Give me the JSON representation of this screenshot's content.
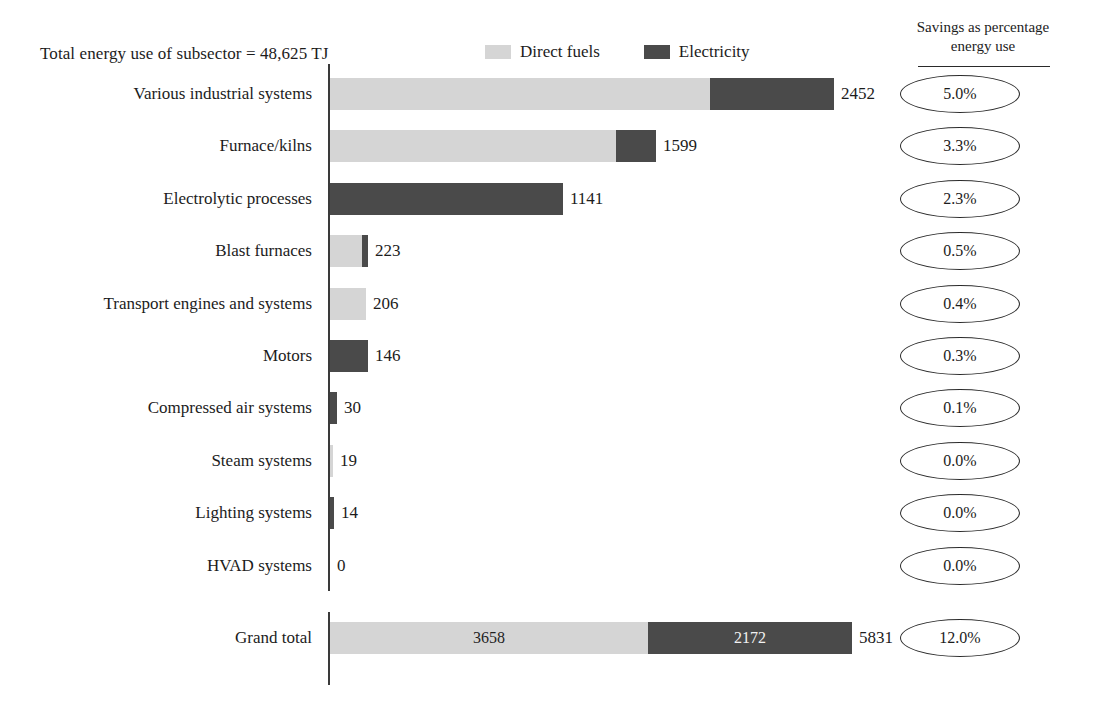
{
  "title": "Total energy use of subsector = 48,625 TJ",
  "legend": [
    {
      "label": "Direct fuels",
      "color": "#d5d5d5"
    },
    {
      "label": "Electricity",
      "color": "#4a4a4a"
    }
  ],
  "savings_header": {
    "line1": "Savings as percentage",
    "line2": "energy use"
  },
  "colors": {
    "direct_fuels": "#d5d5d5",
    "electricity": "#4a4a4a",
    "axis": "#3a3a3a",
    "text": "#1c1c1c"
  },
  "chart_data": {
    "type": "bar",
    "orientation": "horizontal",
    "stacked": true,
    "title": "Total energy use of subsector = 48,625 TJ",
    "xlabel": "",
    "ylabel": "",
    "grid": false,
    "legend_position": "top",
    "categories": [
      "Various industrial systems",
      "Furnace/kilns",
      "Electrolytic processes",
      "Blast furnaces",
      "Transport engines and systems",
      "Motors",
      "Compressed air systems",
      "Steam systems",
      "Lighting systems",
      "HVAD systems"
    ],
    "series": [
      {
        "name": "Direct fuels",
        "color": "#d5d5d5",
        "values": [
          1948,
          1448,
          0,
          209,
          206,
          0,
          0,
          19,
          0,
          0
        ]
      },
      {
        "name": "Electricity",
        "color": "#4a4a4a",
        "values": [
          504,
          151,
          1141,
          14,
          0,
          146,
          30,
          0,
          14,
          0
        ]
      }
    ],
    "totals": [
      2452,
      1599,
      1141,
      223,
      206,
      146,
      30,
      19,
      14,
      0
    ],
    "total_labels": [
      "2452",
      "1599",
      "1141",
      "223",
      "206",
      "146",
      "30",
      "19",
      "14",
      "0"
    ],
    "savings_percent": [
      "5.0%",
      "3.3%",
      "2.3%",
      "0.5%",
      "0.4%",
      "0.3%",
      "0.1%",
      "0.0%",
      "0.0%",
      "0.0%"
    ],
    "grand_total": {
      "label": "Grand total",
      "direct_fuels": 3658,
      "direct_fuels_label": "3658",
      "electricity": 2172,
      "electricity_label": "2172",
      "total": 5831,
      "total_label": "5831",
      "savings_percent": "12.0%"
    },
    "total_energy_use_tj": 48625,
    "units": "TJ"
  },
  "rows": [
    {
      "label": "Various industrial systems",
      "total_label": "2452",
      "savings": "5.0%",
      "light_w": 380,
      "dark_w": 124
    },
    {
      "label": "Furnace/kilns",
      "total_label": "1599",
      "savings": "3.3%",
      "light_w": 286,
      "dark_w": 40
    },
    {
      "label": "Electrolytic processes",
      "total_label": "1141",
      "savings": "2.3%",
      "light_w": 0,
      "dark_w": 233
    },
    {
      "label": "Blast furnaces",
      "total_label": "223",
      "savings": "0.5%",
      "light_w": 32,
      "dark_w": 6
    },
    {
      "label": "Transport engines and systems",
      "total_label": "206",
      "savings": "0.4%",
      "light_w": 36,
      "dark_w": 0
    },
    {
      "label": "Motors",
      "total_label": "146",
      "savings": "0.3%",
      "light_w": 0,
      "dark_w": 38
    },
    {
      "label": "Compressed air systems",
      "total_label": "30",
      "savings": "0.1%",
      "light_w": 0,
      "dark_w": 7
    },
    {
      "label": "Steam systems",
      "total_label": "19",
      "savings": "0.0%",
      "light_w": 3,
      "dark_w": 0
    },
    {
      "label": "Lighting systems",
      "total_label": "14",
      "savings": "0.0%",
      "light_w": 0,
      "dark_w": 4
    },
    {
      "label": "HVAD systems",
      "total_label": "0",
      "savings": "0.0%",
      "light_w": 0,
      "dark_w": 0
    }
  ],
  "grand_total_row": {
    "label": "Grand total",
    "light_w": 318,
    "dark_w": 204,
    "light_label": "3658",
    "dark_label": "2172",
    "total_label": "5831",
    "savings": "12.0%"
  }
}
